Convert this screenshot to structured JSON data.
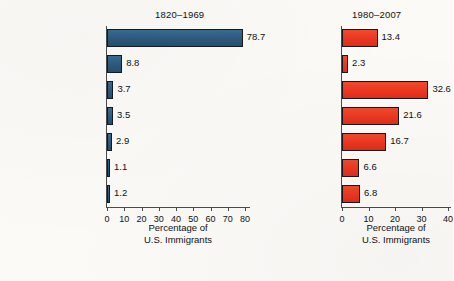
{
  "chart_data": {
    "type": "bar",
    "orientation": "horizontal",
    "title": "",
    "categories": [
      "Europe",
      "Canada",
      "Asia",
      "Mexico",
      "Central America/\nCaribbean",
      "South America",
      "Other"
    ],
    "panels": [
      {
        "title": "1820–1969",
        "color": "#2e5f84",
        "values": [
          78.7,
          8.8,
          3.7,
          3.5,
          2.9,
          1.1,
          1.2
        ],
        "value_labels": [
          "78.7",
          "8.8",
          "3.7",
          "3.5",
          "2.9",
          "1.1",
          "1.2"
        ],
        "xlabel": "Percentage of\nU.S. Immigrants",
        "xlim": [
          0,
          80
        ],
        "xticks": [
          0,
          10,
          20,
          30,
          40,
          50,
          60,
          70,
          80
        ],
        "xticklabels": [
          "0",
          "10",
          "20",
          "30",
          "40",
          "50",
          "60",
          "70",
          "80"
        ]
      },
      {
        "title": "1980–2007",
        "color": "#ee3a24",
        "values": [
          13.4,
          2.3,
          32.6,
          21.6,
          16.7,
          6.6,
          6.8
        ],
        "value_labels": [
          "13.4",
          "2.3",
          "32.6",
          "21.6",
          "16.7",
          "6.6",
          "6.8"
        ],
        "xlabel": "Percentage of\nU.S. Immigrants",
        "xlim": [
          0,
          40
        ],
        "xticks": [
          0,
          10,
          20,
          30,
          40
        ],
        "xticklabels": [
          "0",
          "10",
          "20",
          "30",
          "40"
        ]
      }
    ],
    "ylabel": "",
    "grid": false,
    "legend": "none"
  }
}
